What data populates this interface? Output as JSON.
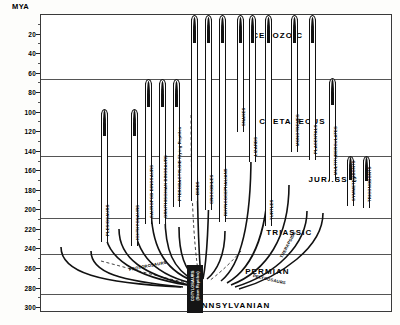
{
  "axis": {
    "title": "MYA",
    "ticks": [
      20,
      40,
      60,
      80,
      100,
      120,
      140,
      160,
      180,
      200,
      220,
      240,
      260,
      280,
      300
    ],
    "min": 0,
    "max": 305,
    "unit": "MYA"
  },
  "periods": [
    {
      "name": "CENOZOIC",
      "top": 0,
      "bottom": 66,
      "label_x": 0.6,
      "label_y": 20
    },
    {
      "name": "CRETACEOUS",
      "top": 66,
      "bottom": 144,
      "label_x": 0.62,
      "label_y": 108
    },
    {
      "name": "JURASSIC",
      "top": 144,
      "bottom": 208,
      "label_x": 0.76,
      "label_y": 168
    },
    {
      "name": "TRIASSIC",
      "top": 208,
      "bottom": 245,
      "label_x": 0.64,
      "label_y": 222
    },
    {
      "name": "PERMIAN",
      "top": 245,
      "bottom": 286,
      "label_x": 0.58,
      "label_y": 262
    },
    {
      "name": "PENNSYLVANIAN",
      "top": 286,
      "bottom": 305,
      "label_x": 0.42,
      "label_y": 297
    }
  ],
  "period_lines": [
    66,
    144,
    208,
    245,
    286
  ],
  "trunk": {
    "name": "COTYLOSAURS (Stem Reptiles)",
    "line1": "COTYLOSAURS",
    "line2": "(Stem Reptiles)"
  },
  "branches": [
    {
      "name": "PLESIOSAURS",
      "x": 60,
      "top": 96,
      "base": 232
    },
    {
      "name": "ICHTHYOSAURS",
      "x": 90,
      "top": 96,
      "base": 236
    },
    {
      "name": "SAUROPOD DINOSAURS",
      "x": 104,
      "top": 66,
      "base": 214
    },
    {
      "name": "ORNITHISCHIAN DINOSAURS",
      "x": 118,
      "top": 66,
      "base": 214
    },
    {
      "name": "PTERODACTYLOID Flying Reptiles",
      "x": 132,
      "top": 66,
      "base": 196
    },
    {
      "name": "BIRDS",
      "x": 150,
      "top": 0,
      "base": 190
    },
    {
      "name": "CROCODILES",
      "x": 164,
      "top": 0,
      "base": 200
    },
    {
      "name": "RHYNCOCEPHALIANS",
      "x": 178,
      "top": 0,
      "base": 212
    },
    {
      "name": "SNAKES",
      "x": 196,
      "top": 0,
      "base": 120
    },
    {
      "name": "LIZARDS",
      "x": 208,
      "top": 0,
      "base": 150
    },
    {
      "name": "TURTLES",
      "x": 224,
      "top": 0,
      "base": 216
    },
    {
      "name": "MONOTREMES",
      "x": 250,
      "top": 0,
      "base": 140
    },
    {
      "name": "PLACENTALS",
      "x": 268,
      "top": 0,
      "base": 148
    },
    {
      "name": "MULTITUBERCULATES",
      "x": 288,
      "top": 64,
      "base": 170
    },
    {
      "name": "SYMMETRODONTS",
      "x": 306,
      "top": 144,
      "base": 196
    },
    {
      "name": "TRICONODONTS",
      "x": 322,
      "top": 144,
      "base": 198
    }
  ],
  "arc_labels": [
    {
      "name": "PROTOROSAURS",
      "x": 88,
      "y": 252,
      "rot": -11
    },
    {
      "name": "PELYCOSAURS",
      "x": 212,
      "y": 258,
      "rot": 13
    },
    {
      "name": "THERAPSIDS",
      "x": 240,
      "y": 240,
      "rot": -62
    }
  ],
  "colors": {
    "ink": "#111111",
    "rule": "#555555",
    "frame": "#3a3a3a",
    "paper": "#ffffff"
  }
}
